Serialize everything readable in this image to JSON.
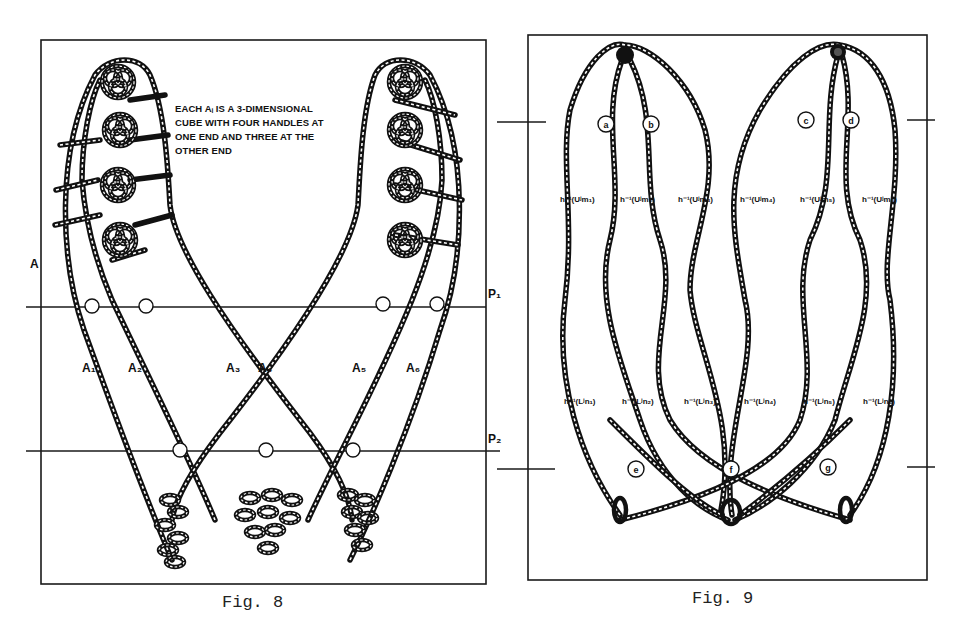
{
  "figures": [
    {
      "id": "fig8",
      "caption": "Fig. 8",
      "note_lines": [
        "EACH  Aᵢ  IS A 3-DIMENSIONAL",
        "CUBE WITH FOUR HANDLES AT",
        "ONE END AND THREE AT THE",
        "OTHER END"
      ],
      "side_label": "A",
      "plane_labels": [
        "P₁",
        "P₂"
      ],
      "cube_labels": [
        "A₁",
        "A₂",
        "A₃",
        "A₄",
        "A₅",
        "A₆"
      ]
    },
    {
      "id": "fig9",
      "caption": "Fig. 9",
      "top_markers": [
        "a",
        "b",
        "c",
        "d"
      ],
      "bottom_markers": [
        "e",
        "f",
        "g"
      ],
      "upper_labels": [
        "h⁻¹(Uʲm₁)",
        "h⁻¹(Uʲm₂)",
        "h⁻¹(Uʲm₃)",
        "h⁻¹(Uʲm₄)",
        "h⁻¹(Uʲm₅)",
        "h⁻¹(Uʲm₆)"
      ],
      "lower_labels": [
        "h⁻¹(Lʲn₁)",
        "h⁻¹(Lʲn₂)",
        "h⁻¹(Lʲn₃)",
        "h⁻¹(Lʲn₄)",
        "h⁻¹(Lʲn₅)",
        "h⁻¹(Lʲn₆)"
      ]
    }
  ]
}
